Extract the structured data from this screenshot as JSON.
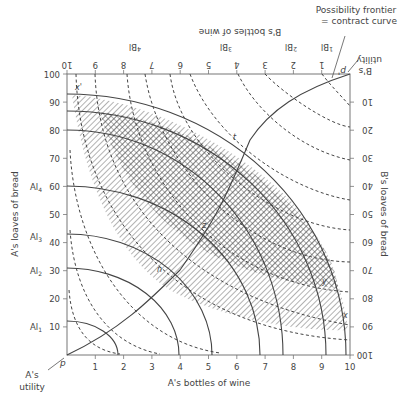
{
  "diagram": {
    "type": "edgeworth-box",
    "callout": {
      "line1": "Possibility frontier",
      "line2": "= contract curve"
    },
    "axes": {
      "a_x_label": "A's bottles of wine",
      "a_y_label": "A's loaves of bread",
      "b_x_label": "B's bottles of wine",
      "b_y_label": "B's loaves of bread",
      "a_x_ticks": [
        "1",
        "2",
        "3",
        "4",
        "5",
        "6",
        "7",
        "8",
        "9",
        "10"
      ],
      "a_y_ticks": [
        "10",
        "20",
        "30",
        "40",
        "50",
        "60",
        "70",
        "80",
        "90",
        "100"
      ],
      "b_x_ticks": [
        "1",
        "2",
        "3",
        "4",
        "5",
        "6",
        "7",
        "8",
        "9",
        "10"
      ],
      "b_y_ticks": [
        "10",
        "20",
        "30",
        "40",
        "50",
        "60",
        "70",
        "80",
        "90",
        "100"
      ]
    },
    "origins": {
      "a_origin": "p",
      "b_origin": "p'",
      "a_utility_line1": "A's",
      "a_utility_line2": "utility",
      "b_utility_line1": "B's",
      "b_utility_line2": "utility"
    },
    "a_indifference_labels": [
      "Al1",
      "Al2",
      "Al3",
      "Al4"
    ],
    "b_indifference_labels": [
      "Bl1",
      "Bl2",
      "Bl3",
      "Bl4"
    ],
    "points": {
      "x": "x",
      "x_prime": "x'",
      "y": "y",
      "z": "z",
      "t": "t",
      "n": "n"
    }
  }
}
